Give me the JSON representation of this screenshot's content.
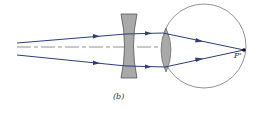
{
  "figure": {
    "caption": "(b)",
    "focal_point_label": "P'",
    "colors": {
      "ray": "#2b3f7a",
      "axis": "#777777",
      "lens_fill": "#a9a9a9",
      "lens_stroke": "#555555",
      "eye_stroke": "#666666",
      "focal_point": "#111111"
    },
    "elements": [
      "incoming-parallel-rays",
      "concave-corrective-lens",
      "optical-axis",
      "eye-crystalline-lens",
      "eyeball",
      "focal-point-on-retina"
    ]
  }
}
